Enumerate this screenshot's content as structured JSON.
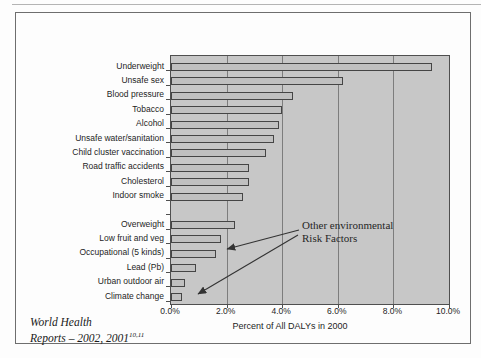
{
  "page": {
    "source_note": {
      "line1": "World Health",
      "line2": "Reports – 2002, 2001",
      "superscript": "10,11"
    }
  },
  "chart_data": {
    "type": "bar",
    "orientation": "horizontal",
    "title": "",
    "xlabel": "Percent of All DALYs in 2000",
    "ylabel": "",
    "xlim": [
      0,
      10
    ],
    "x_tick_labels": [
      "0.0%",
      "2.0%",
      "4.0%",
      "6.0%",
      "8.0%",
      "10.0%"
    ],
    "grid": true,
    "legend": "none",
    "categories": [
      "Underweight",
      "Unsafe sex",
      "Blood pressure",
      "Tobacco",
      "Alcohol",
      "Unsafe water/sanitation",
      "Child cluster vaccination",
      "Road traffic accidents",
      "Cholesterol",
      "Indoor smoke",
      "Overweight",
      "Low fruit and veg",
      "Occupational (5 kinds)",
      "Lead (Pb)",
      "Urban outdoor air",
      "Climate change"
    ],
    "values": [
      9.4,
      6.2,
      4.4,
      4.0,
      3.9,
      3.7,
      3.4,
      2.8,
      2.8,
      2.6,
      2.3,
      1.8,
      1.6,
      0.9,
      0.5,
      0.4
    ],
    "group_break_after_index": 9,
    "annotation": {
      "line1": "Other environmental",
      "line2": "Risk Factors",
      "points_to": [
        "Occupational (5 kinds)",
        "Climate change"
      ]
    },
    "colors": {
      "plot_background": "#c7c7c7",
      "bar_fill": "#c0c0c0",
      "bar_border": "#454545",
      "gridline": "#7d7d7d",
      "axis": "#4f4f4f",
      "text": "#1d1d1d"
    }
  }
}
